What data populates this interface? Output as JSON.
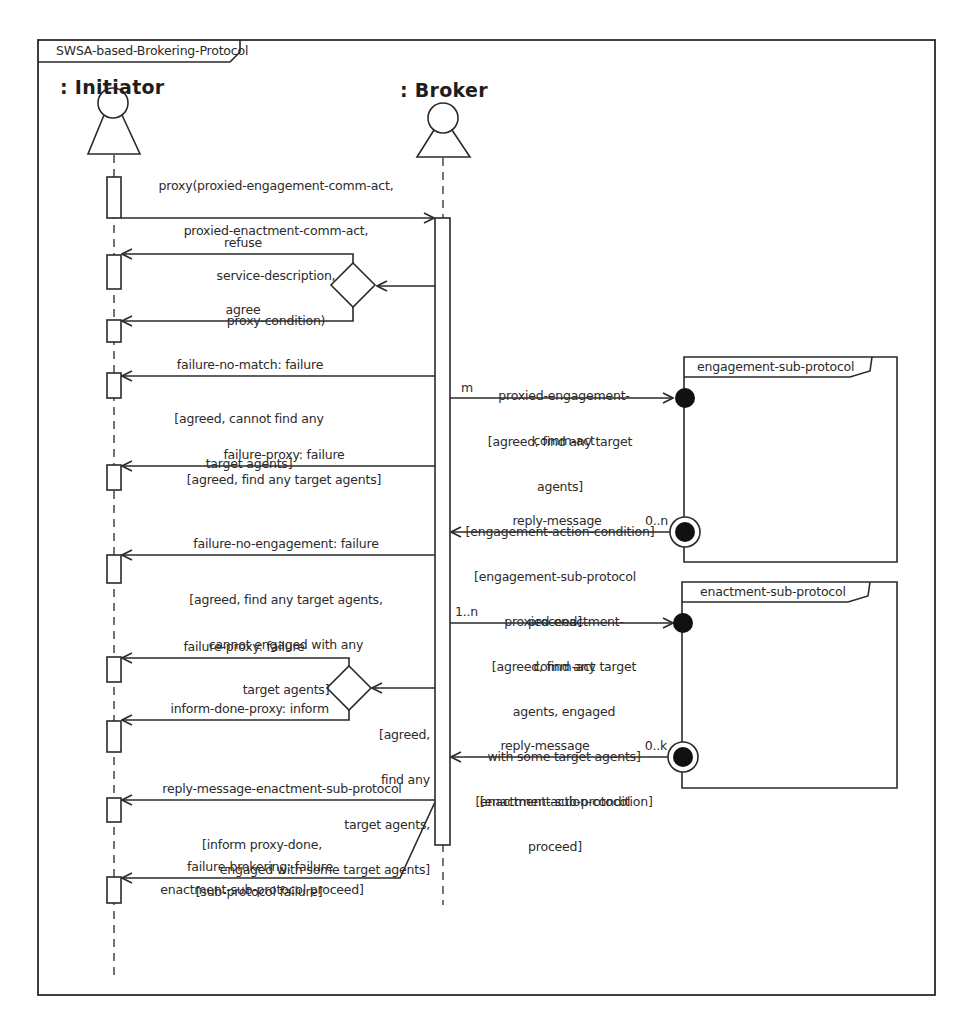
{
  "diagram": {
    "title": "SWSA-based-Brokering-Protocol",
    "type": "AUML sequence diagram",
    "colors": {
      "line": "#2a2a2a",
      "background": "#ffffff",
      "node_fill": "#111111"
    }
  },
  "lifelines": [
    {
      "id": "initiator",
      "name": ": Initiator"
    },
    {
      "id": "broker",
      "name": ": Broker"
    }
  ],
  "messages": {
    "proxy": {
      "label_lines": [
        "proxy(proxied-engagement-comm-act,",
        "proxied-enactment-comm-act,",
        "service-description,",
        "proxy-condition)"
      ],
      "from": "initiator",
      "to": "broker"
    },
    "refuse": {
      "label": "refuse",
      "from": "broker",
      "to": "initiator"
    },
    "agree": {
      "label": "agree",
      "from": "broker",
      "to": "initiator"
    },
    "failure_no_match": {
      "label": "failure-no-match: failure",
      "guard_lines": [
        "[agreed, cannot find any",
        "target agents]"
      ],
      "from": "broker",
      "to": "initiator"
    },
    "failure_proxy_1": {
      "label": "failure-proxy: failure",
      "guard_lines": [
        "[agreed, find any target agents]"
      ],
      "from": "broker",
      "to": "initiator"
    },
    "failure_no_engagement": {
      "label": "failure-no-engagement: failure",
      "guard_lines": [
        "[agreed, find any target agents,",
        "cannot engaged with any",
        "target agents]"
      ],
      "from": "broker",
      "to": "initiator"
    },
    "failure_proxy_2": {
      "label": "failure-proxy: failure",
      "from": "broker",
      "to": "initiator"
    },
    "inform_done_proxy": {
      "label": "inform-done-proxy: inform",
      "from": "broker",
      "to": "initiator"
    },
    "decision_2_guard": {
      "guard_lines": [
        "[agreed,",
        "find any",
        "target agents,",
        "engaged with some target agents]"
      ]
    },
    "reply_message_enactment": {
      "label": "reply-message-enactment-sub-protocol",
      "guard_lines": [
        "[inform proxy-done,",
        "enactment-sub-protocol proceed]"
      ],
      "from": "broker",
      "to": "initiator"
    },
    "failure_brokering": {
      "label": "failure-brokering: failure",
      "guard_lines": [
        "[sub-protocol failure]"
      ],
      "from": "broker",
      "to": "initiator"
    },
    "proxied_engagement": {
      "label_lines": [
        "proxied-engagement-",
        "comm-act"
      ],
      "multiplicity": "m",
      "guard_lines": [
        "[agreed, find any target",
        "agents]",
        "[engagement-action-condition]"
      ],
      "from": "broker",
      "to": "engagement-sub-protocol"
    },
    "reply_engagement": {
      "label": "reply-message",
      "multiplicity": "0..n",
      "guard_lines": [
        "[engagement-sub-protocol",
        "proceed]"
      ],
      "from": "engagement-sub-protocol",
      "to": "broker"
    },
    "proxied_enactment": {
      "label_lines": [
        "proxied-enactment-",
        "comm-act"
      ],
      "multiplicity": "1..n",
      "guard_lines": [
        "[agreed, find any target",
        "agents, engaged",
        "with some target agents]",
        "[enactment-action-condition]"
      ],
      "from": "broker",
      "to": "enactment-sub-protocol"
    },
    "reply_enactment": {
      "label": "reply-message",
      "multiplicity": "0..k",
      "guard_lines": [
        "[enactment-sub-protocol",
        "proceed]"
      ],
      "from": "enactment-sub-protocol",
      "to": "broker"
    }
  },
  "sub_protocols": [
    {
      "id": "engagement",
      "title": "engagement-sub-protocol"
    },
    {
      "id": "enactment",
      "title": "enactment-sub-protocol"
    }
  ],
  "icons": {
    "actor": "stick-actor-icon (circle over triangle)",
    "decision": "diamond",
    "initial_node": "filled-circle",
    "final_node": "bullseye-circle"
  }
}
